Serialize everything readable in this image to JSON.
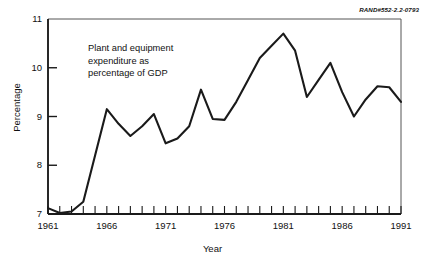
{
  "figure": {
    "rand_id": "RAND#552-2.2-0793",
    "annotation": "Plant and equipment\nexpenditure as\npercentage of GDP"
  },
  "chart_data": {
    "type": "line",
    "title": "",
    "subtitle": "",
    "xlabel": "Year",
    "ylabel": "Percentage",
    "xlim": [
      1961,
      1991
    ],
    "ylim": [
      7,
      11
    ],
    "grid": false,
    "legend": null,
    "annotations": [
      "Plant and equipment expenditure as percentage of GDP"
    ],
    "y_ticks": [
      7,
      8,
      9,
      10,
      11
    ],
    "y_tick_labels": [
      "7",
      "8",
      "9",
      "10",
      "11"
    ],
    "x_ticks": [
      1961,
      1966,
      1971,
      1976,
      1981,
      1986,
      1991
    ],
    "x_tick_labels": [
      "1961",
      "1966",
      "1971",
      "1976",
      "1981",
      "1986",
      "1991"
    ],
    "x_minor_tick_interval": 1,
    "line_color": "#1a1a1a",
    "line_width": 2.1,
    "x": [
      1961,
      1962,
      1963,
      1964,
      1965,
      1966,
      1967,
      1968,
      1969,
      1970,
      1971,
      1972,
      1973,
      1974,
      1975,
      1976,
      1977,
      1978,
      1979,
      1980,
      1981,
      1982,
      1983,
      1984,
      1985,
      1986,
      1987,
      1988,
      1989,
      1990,
      1991
    ],
    "values": [
      7.12,
      7.02,
      7.05,
      7.25,
      8.2,
      9.15,
      8.85,
      8.6,
      8.8,
      9.05,
      8.45,
      8.55,
      8.8,
      9.55,
      8.95,
      8.93,
      9.3,
      9.75,
      10.2,
      10.45,
      10.7,
      10.35,
      9.4,
      9.75,
      10.1,
      9.5,
      9.0,
      9.35,
      9.62,
      9.6,
      9.3
    ],
    "series": [
      {
        "name": "Plant and equipment expenditure as percentage of GDP",
        "values": [
          7.12,
          7.02,
          7.05,
          7.25,
          8.2,
          9.15,
          8.85,
          8.6,
          8.8,
          9.05,
          8.45,
          8.55,
          8.8,
          9.55,
          8.95,
          8.93,
          9.3,
          9.75,
          10.2,
          10.45,
          10.7,
          10.35,
          9.4,
          9.75,
          10.1,
          9.5,
          9.0,
          9.35,
          9.62,
          9.6,
          9.3
        ]
      }
    ]
  }
}
